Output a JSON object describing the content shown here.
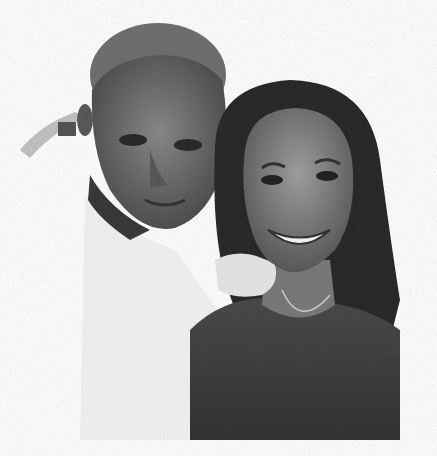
{
  "image": {
    "type": "photograph",
    "style": "grayscale",
    "description": "Selfie of an elderly man and a smiling young woman with long straight hair",
    "colors": {
      "background": "#ffffff",
      "hair": "#2a2a2a",
      "skin_dark": "#4a4a4a",
      "skin_mid": "#7a7a7a",
      "shirt_light": "#e8e8e8",
      "top_dark": "#3c3c3c"
    }
  }
}
